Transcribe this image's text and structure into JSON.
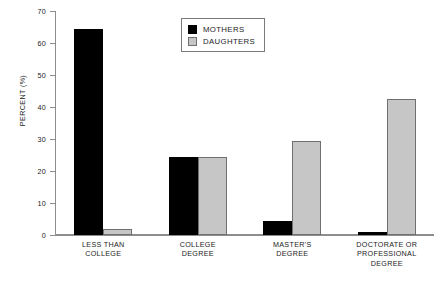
{
  "chart_data": {
    "type": "bar",
    "title": "",
    "xlabel": "",
    "ylabel": "PERCENT (%)",
    "ylim": [
      0,
      70
    ],
    "yticks": [
      0,
      10,
      20,
      30,
      40,
      50,
      60,
      70
    ],
    "ytick_labels": [
      "0",
      "10",
      "20",
      "30",
      "40",
      "50",
      "60",
      "70"
    ],
    "grid": false,
    "legend_position": "top-center",
    "categories": [
      "LESS THAN COLLEGE",
      "COLLEGE DEGREE",
      "MASTER'S DEGREE",
      "DOCTORATE OR PROFESSIONAL DEGREE"
    ],
    "category_lines": [
      [
        "LESS THAN",
        "COLLEGE"
      ],
      [
        "COLLEGE",
        "DEGREE"
      ],
      [
        "MASTER'S",
        "DEGREE"
      ],
      [
        "DOCTORATE OR",
        "PROFESSIONAL",
        "DEGREE"
      ]
    ],
    "series": [
      {
        "name": "MOTHERS",
        "color": "#000000",
        "values": [
          64.5,
          24.5,
          4.5,
          1.0
        ]
      },
      {
        "name": "DAUGHTERS",
        "color": "#c6c6c6",
        "values": [
          2.0,
          24.5,
          29.5,
          42.5
        ]
      }
    ]
  },
  "axis": {
    "y_title": "PERCENT (%)"
  },
  "legend": {
    "items": [
      {
        "label": "MOTHERS",
        "color": "#000000"
      },
      {
        "label": "DAUGHTERS",
        "color": "#c6c6c6"
      }
    ]
  }
}
